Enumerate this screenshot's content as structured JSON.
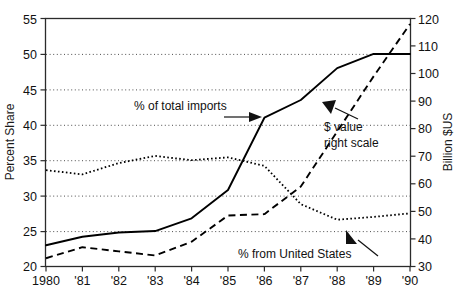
{
  "chart_data": {
    "type": "line",
    "title": "",
    "xlabel": "",
    "ylabel": "Percent Share",
    "y2label": "Billion $US",
    "grid": true,
    "legend_position": "inline-annotations",
    "x": [
      1980,
      1981,
      1982,
      1983,
      1984,
      1985,
      1986,
      1987,
      1988,
      1989,
      1990
    ],
    "categories": [
      "1980",
      "'81",
      "'82",
      "'83",
      "'84",
      "'85",
      "'86",
      "'87",
      "'88",
      "'89",
      "'90"
    ],
    "ylim": [
      20,
      55
    ],
    "yticks": [
      20,
      25,
      30,
      35,
      40,
      45,
      50,
      55
    ],
    "ytick_labels": [
      "20",
      "25",
      "30",
      "35",
      "40",
      "45",
      "50",
      "55"
    ],
    "y2lim": [
      30,
      120
    ],
    "y2ticks": [
      30,
      40,
      50,
      60,
      70,
      80,
      90,
      100,
      110,
      120
    ],
    "y2tick_labels": [
      "30",
      "40",
      "50",
      "60",
      "70",
      "80",
      "90",
      "100",
      "110",
      "120"
    ],
    "series": [
      {
        "name": "% of total imports",
        "axis": "left",
        "style": "solid",
        "values": [
          23.0,
          24.2,
          24.8,
          25.0,
          26.8,
          30.8,
          41.0,
          43.5,
          48.0,
          50.0,
          50.0
        ]
      },
      {
        "name": "% from United States",
        "axis": "left",
        "style": "dotted",
        "values": [
          33.6,
          33.0,
          34.6,
          35.6,
          35.0,
          35.4,
          34.2,
          28.8,
          26.6,
          27.0,
          27.5
        ]
      },
      {
        "name": "$ value",
        "axis": "right",
        "style": "dashed",
        "values": [
          33.0,
          37.0,
          35.5,
          34.0,
          39.0,
          48.5,
          49.0,
          59.0,
          79.0,
          99.0,
          118.0
        ]
      }
    ],
    "annotations": [
      {
        "text": "% of total imports",
        "target_series": "% of total imports",
        "arrow": "right"
      },
      {
        "text_line1": "$ value",
        "text_line2": "right scale",
        "target_series": "$ value",
        "arrow": "up-left"
      },
      {
        "text": "% from United States",
        "target_series": "% from United States",
        "arrow": "up-right"
      }
    ],
    "colors": {
      "line": "#000000",
      "grid": "#3a3a3a",
      "frame": "#2b2b2b",
      "background": "#ffffff"
    }
  }
}
